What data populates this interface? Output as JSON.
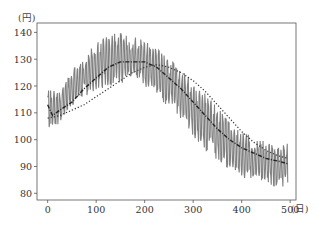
{
  "chart_data": {
    "type": "line",
    "title": "",
    "xlabel": "(日)",
    "ylabel": "(円)",
    "xlim": [
      -22,
      512
    ],
    "ylim": [
      77.5,
      143.5
    ],
    "x_ticks": [
      0,
      100,
      200,
      300,
      400,
      500
    ],
    "y_ticks": [
      80,
      90,
      100,
      110,
      120,
      130,
      140
    ],
    "grid": false,
    "legend": null,
    "series": [
      {
        "name": "price",
        "style": "solid",
        "color": "#808080",
        "description": "Noisy daily price oscillating about ±10 yen around the trend; roughly 500 daily points",
        "x": [
          0,
          25,
          50,
          75,
          100,
          125,
          150,
          175,
          200,
          225,
          250,
          275,
          300,
          325,
          350,
          375,
          400,
          425,
          450,
          475,
          495
        ],
        "y_low": [
          103,
          106,
          112,
          116,
          118,
          120,
          121,
          121,
          120,
          116,
          112,
          107,
          101,
          96,
          92,
          88,
          86,
          85,
          84,
          82,
          83
        ],
        "y_high": [
          119,
          118,
          126,
          131,
          136,
          139,
          140,
          139,
          137,
          134,
          131,
          127,
          122,
          117,
          112,
          107,
          103,
          101,
          99,
          97,
          100
        ]
      },
      {
        "name": "moving-average",
        "style": "dashdot",
        "color": "#222222",
        "x": [
          0,
          10,
          25,
          50,
          75,
          100,
          125,
          150,
          175,
          200,
          225,
          250,
          275,
          300,
          325,
          350,
          375,
          400,
          425,
          450,
          475,
          495
        ],
        "y": [
          113,
          109,
          111,
          114,
          119,
          123,
          127,
          129,
          129,
          129,
          127,
          123,
          119,
          114,
          109,
          104,
          100,
          97,
          95,
          93,
          92,
          91
        ]
      },
      {
        "name": "trend",
        "style": "dotted",
        "color": "#333333",
        "x": [
          0,
          25,
          50,
          75,
          100,
          125,
          150,
          175,
          200,
          225,
          250,
          275,
          300,
          325,
          350,
          375,
          400,
          425,
          450,
          475,
          495
        ],
        "y": [
          108,
          109,
          111,
          113,
          116,
          119,
          122,
          125,
          127,
          128,
          127,
          125,
          122,
          118,
          113,
          108,
          103,
          99,
          96,
          94,
          93
        ]
      }
    ]
  },
  "axes": {
    "x_unit": "(日)",
    "y_unit": "(円)"
  }
}
